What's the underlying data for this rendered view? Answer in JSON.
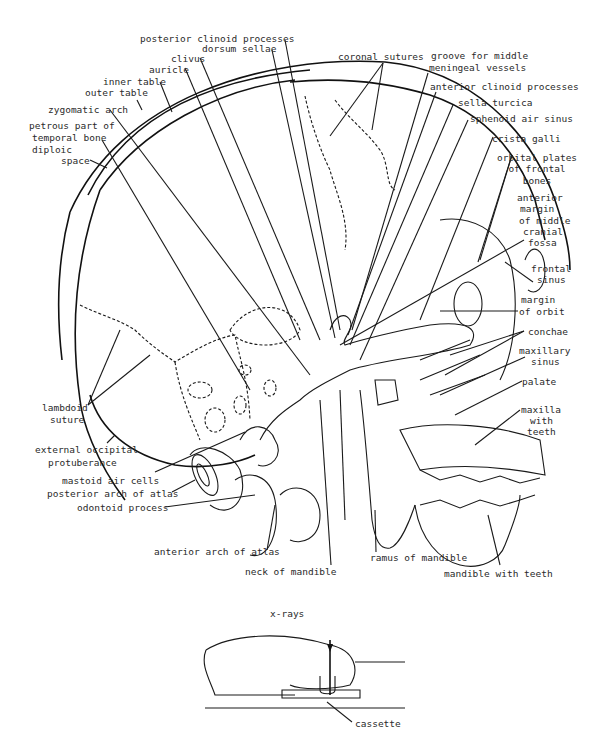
{
  "diagram": {
    "labels": {
      "posterior_clinoid": "posterior clinoid processes",
      "dorsum_sellae": "dorsum sellae",
      "clivus": "clivus",
      "auricle": "auricle",
      "inner_table": "inner table",
      "outer_table": "outer table",
      "zygomatic_arch": "zygomatic arch",
      "petrous_1": "petrous part of",
      "petrous_2": "temporal bone",
      "diploic_1": "diploic",
      "diploic_2": "space",
      "coronal_sutures": "coronal sutures",
      "groove_1": "groove for middle",
      "groove_2": "meningeal  vessels",
      "anterior_clinoid": "anterior clinoid processes",
      "sella_turcica": "sella turcica",
      "sphenoid": "sphenoid air sinus",
      "crista_galli": "crista galli",
      "orbital_1": "orbital plates",
      "orbital_2": "of frontal",
      "orbital_3": "bones",
      "amcf_1": "anterior",
      "amcf_2": "margin",
      "amcf_3": "of middle",
      "amcf_4": "cranial",
      "amcf_5": "fossa",
      "frontal_1": "frontal",
      "frontal_2": "sinus",
      "orbit_1": "margin",
      "orbit_2": "of orbit",
      "conchae": "conchae",
      "maxsinus_1": "maxillary",
      "maxsinus_2": "sinus",
      "palate": "palate",
      "maxilla_1": "maxilla",
      "maxilla_2": "with",
      "maxilla_3": "teeth",
      "lambdoid_1": "lambdoid",
      "lambdoid_2": "suture",
      "eop_1": "external occipital",
      "eop_2": "protuberance",
      "mastoid": "mastoid air cells",
      "posterior_arch": "posterior arch of atlas",
      "odontoid": "odontoid process",
      "anterior_arch": "anterior arch of atlas",
      "neck_mandible": "neck of mandible",
      "ramus": "ramus of mandible",
      "mandible_teeth": "mandible with teeth",
      "xrays": "x-rays",
      "cassette": "cassette"
    }
  }
}
